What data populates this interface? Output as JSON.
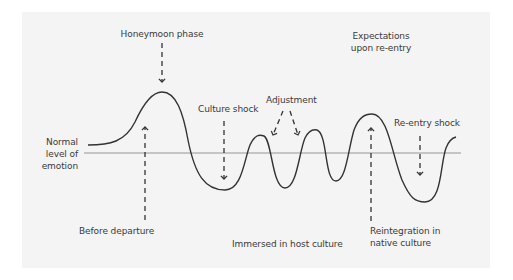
{
  "diagram": {
    "baseline_label": [
      "Normal",
      "level of",
      "emotion"
    ],
    "labels": {
      "honeymoon": "Honeymoon phase",
      "culture_shock": "Culture shock",
      "adjustment": "Adjustment",
      "expectations_line1": "Expectations",
      "expectations_line2": "upon re-entry",
      "reentry_shock": "Re-entry shock",
      "before_departure": "Before departure",
      "immersed": "Immersed in host culture",
      "reintegration_line1": "Reintegration in",
      "reintegration_line2": "native culture"
    },
    "colors": {
      "panel": "#f4f4f4",
      "curve": "#333333",
      "baseline": "#777777",
      "text": "#3a3a3a"
    }
  }
}
